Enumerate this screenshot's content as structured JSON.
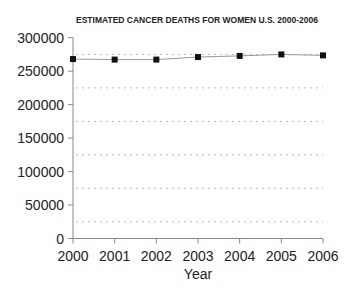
{
  "chart_data": {
    "type": "line",
    "title": "ESTIMATED CANCER DEATHS FOR WOMEN U.S. 2000-2006",
    "xlabel": "Year",
    "ylabel": "",
    "categories": [
      "2000",
      "2001",
      "2002",
      "2003",
      "2004",
      "2005",
      "2006"
    ],
    "series": [
      {
        "name": "Estimated cancer deaths (women)",
        "values": [
          268100,
          267300,
          267300,
          271100,
          272800,
          275000,
          273600
        ]
      }
    ],
    "ylim": [
      0,
      300000
    ],
    "yticks": [
      "0",
      "50000",
      "100000",
      "150000",
      "200000",
      "250000",
      "300000"
    ],
    "gridlines": [
      25000,
      75000,
      125000,
      175000,
      225000,
      275000
    ],
    "grid": "dotted horizontal",
    "legend": "none",
    "colors": {
      "line": "#999999",
      "marker": "#111111",
      "axis": "#888888",
      "grid": "#bbbbbb"
    }
  }
}
